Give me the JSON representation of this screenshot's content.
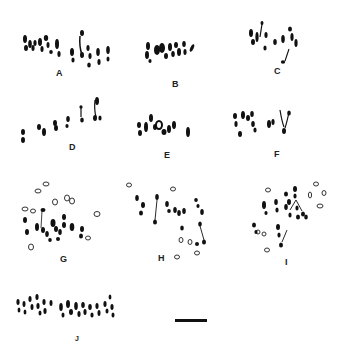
{
  "figure": {
    "panels": [
      {
        "id": "A",
        "label": "A",
        "label_x": 58,
        "label_y": 70
      },
      {
        "id": "B",
        "label": "B",
        "label_x": 173,
        "label_y": 82
      },
      {
        "id": "C",
        "label": "C",
        "label_x": 274,
        "label_y": 68
      },
      {
        "id": "D",
        "label": "D",
        "label_x": 69,
        "label_y": 145
      },
      {
        "id": "E",
        "label": "E",
        "label_x": 165,
        "label_y": 153
      },
      {
        "id": "F",
        "label": "F",
        "label_x": 274,
        "label_y": 152
      },
      {
        "id": "G",
        "label": "G",
        "label_x": 61,
        "label_y": 256
      },
      {
        "id": "H",
        "label": "H",
        "label_x": 158,
        "label_y": 255
      },
      {
        "id": "I",
        "label": "I",
        "label_x": 284,
        "label_y": 259
      },
      {
        "id": "J",
        "label": "J",
        "label_x": 75,
        "label_y": 336
      }
    ],
    "scale_bar": {
      "x": 175,
      "y": 319,
      "width": 32,
      "height": 3,
      "color": "#111111"
    },
    "colors": {
      "chromosome": "#111111",
      "outline": "#333333",
      "background": "#ffffff"
    }
  }
}
